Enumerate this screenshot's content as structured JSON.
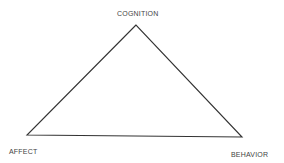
{
  "diagram": {
    "type": "triangle",
    "vertices": {
      "top": {
        "label": "COGNITION"
      },
      "left": {
        "label": "AFFECT"
      },
      "right": {
        "label": "BEHAVIOR"
      }
    },
    "line_color": "#333333",
    "text_color": "#444444"
  }
}
